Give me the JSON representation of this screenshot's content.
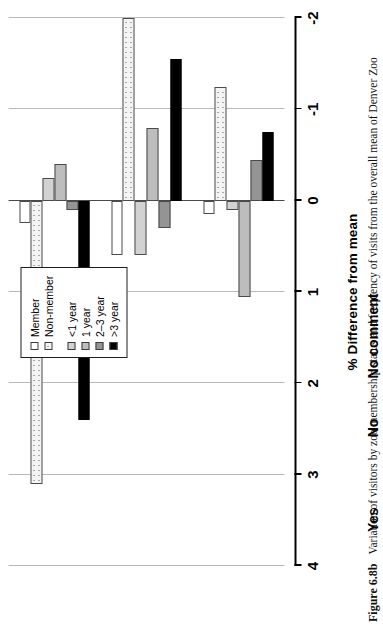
{
  "figure": {
    "number": "Figure 6.8b",
    "caption": "Variation of visitors by zoo membership status and frequency of visits from the overall mean of Denver Zoo"
  },
  "legend": {
    "groups": [
      {
        "items": [
          {
            "label": "Member",
            "key": "member",
            "swatch": "white-square-swatch"
          },
          {
            "label": "Non-member",
            "key": "nonmember",
            "swatch": "dotted-square-swatch"
          }
        ]
      },
      {
        "items": [
          {
            "label": "<1 year",
            "key": "lt1",
            "swatch": "light-gray-square-swatch"
          },
          {
            "label": "1 year",
            "key": "y1",
            "swatch": "gray-square-swatch"
          },
          {
            "label": "2–3 year",
            "key": "y23",
            "swatch": "dark-gray-square-swatch"
          },
          {
            "label": ">3 year",
            "key": "gt3",
            "swatch": "black-square-swatch"
          }
        ]
      }
    ]
  },
  "axis": {
    "title": "% Difference from mean",
    "ticks": [
      "4",
      "3",
      "2",
      "1",
      "0",
      "-1",
      "-2"
    ],
    "min": -2,
    "max": 4
  },
  "colors": {
    "member": "#ffffff",
    "nonmember": "#f4f4f4",
    "lt1": "#d2d2d2",
    "y1": "#bdbdbd",
    "y23": "#949494",
    "gt3": "#000000",
    "gridline": "#b9b9b9",
    "axis": "#000000"
  },
  "chart_data": {
    "type": "bar",
    "title": "Variation of visitors by zoo membership status and frequency of visits from the overall mean of Denver Zoo",
    "xlabel": "",
    "ylabel": "% Difference from mean",
    "ylim": [
      -2,
      4
    ],
    "grid": true,
    "legend_position": "top-right",
    "orientation": "vertical-grouped",
    "categories": [
      "Yes",
      "No",
      "No comment"
    ],
    "series": [
      {
        "name": "Member",
        "key": "member",
        "values": [
          0.25,
          0.6,
          0.15
        ]
      },
      {
        "name": "Non-member",
        "key": "nonmember",
        "values": [
          3.1,
          -2.0,
          -1.25
        ]
      },
      {
        "name": "<1 year",
        "key": "lt1",
        "values": [
          -0.25,
          0.6,
          0.1
        ]
      },
      {
        "name": "1 year",
        "key": "y1",
        "values": [
          -0.4,
          -0.8,
          1.05
        ]
      },
      {
        "name": "2–3 year",
        "key": "y23",
        "values": [
          0.1,
          0.3,
          -0.45
        ]
      },
      {
        "name": ">3 year",
        "key": "gt3",
        "values": [
          2.4,
          -1.55,
          -0.75
        ]
      }
    ]
  }
}
